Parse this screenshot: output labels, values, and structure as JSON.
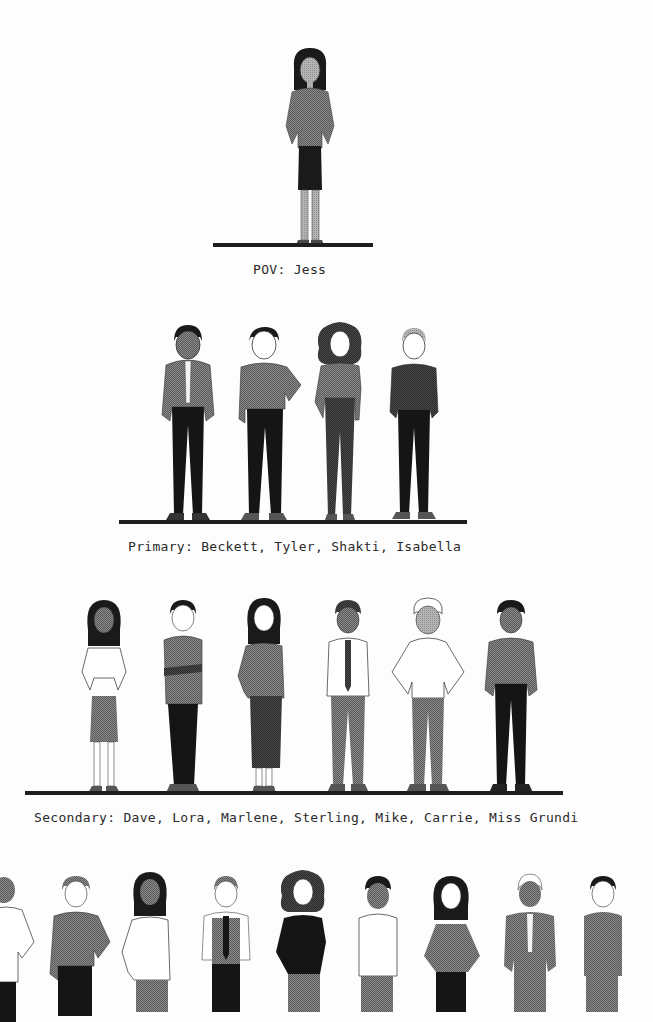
{
  "tiers": [
    {
      "id": "pov",
      "label": "POV: Jess",
      "characters": [
        "Jess"
      ]
    },
    {
      "id": "primary",
      "label": "Primary: Beckett, Tyler, Shakti, Isabella",
      "characters": [
        "Beckett",
        "Tyler",
        "Shakti",
        "Isabella"
      ]
    },
    {
      "id": "secondary",
      "label": "Secondary: Dave, Lora, Marlene, Sterling, Mike, Carrie, Miss Grundi",
      "characters": [
        "Dave",
        "Lora",
        "Marlene",
        "Sterling",
        "Mike",
        "Carrie",
        "Miss Grundi"
      ]
    },
    {
      "id": "tertiary",
      "label": "",
      "characters": [
        "",
        "",
        "",
        "",
        "",
        "",
        "",
        "",
        ""
      ]
    }
  ],
  "colors": {
    "ground": "#1e1e1e",
    "dark": "#1a1a1a",
    "mid": "#6b6b6b",
    "light": "#9a9a9a",
    "skin_light": "#ffffff",
    "skin_dark": "#8c8c8c",
    "background": "#fdfdfd"
  }
}
